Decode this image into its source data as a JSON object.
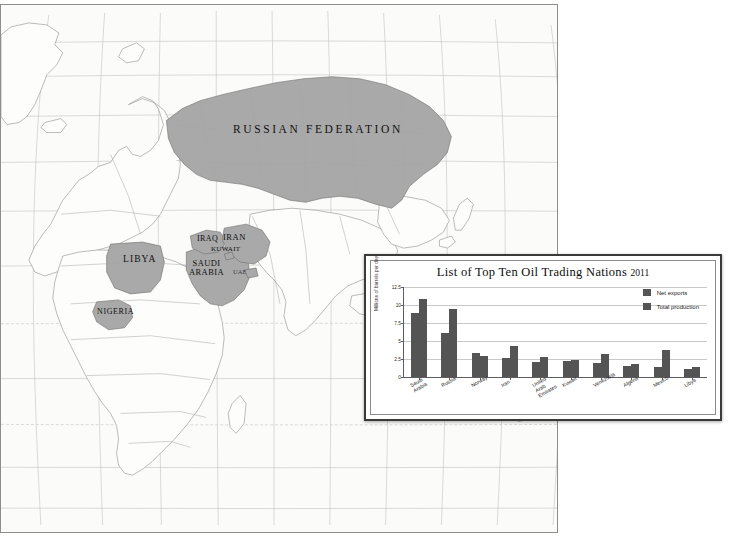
{
  "map": {
    "labels": [
      {
        "id": "russia",
        "text": "RUSSIAN FEDERATION"
      },
      {
        "id": "libya",
        "text": "LIBYA"
      },
      {
        "id": "nigeria",
        "text": "NIGERIA"
      },
      {
        "id": "iraq",
        "text": "IRAQ"
      },
      {
        "id": "iran",
        "text": "IRAN"
      },
      {
        "id": "kuwait",
        "text": "KUWAIT"
      },
      {
        "id": "saudi",
        "text": "SAUDI\nARABIA"
      },
      {
        "id": "uae",
        "text": "UAE"
      }
    ],
    "russia_label": "RUSSIAN FEDERATION",
    "libya_label": "LIBYA",
    "nigeria_label": "NIGERIA",
    "iraq_label": "IRAQ",
    "iran_label": "IRAN",
    "kuwait_label": "KUWAIT",
    "saudi_label_line1": "SAUDI",
    "saudi_label_line2": "ARABIA",
    "uae_label": "UAE",
    "highlight_color": "#a9a9a9",
    "land_color": "#fcfcfb",
    "border_color": "#9a9a9a"
  },
  "chart_data": {
    "type": "bar",
    "title": "List of Top Ten Oil Trading Nations",
    "title_year": "2011",
    "xlabel": "",
    "ylabel": "Millions of barrels per day",
    "ylim": [
      0,
      12.5
    ],
    "yticks": [
      0,
      2.5,
      5,
      7.5,
      10,
      12.5
    ],
    "ytick_labels": [
      "0",
      "2.5",
      "5",
      "7.5",
      "10",
      "12.5"
    ],
    "grid": true,
    "legend_position": "top-right",
    "bar_color": "#545454",
    "categories": [
      "Saudi Arabia",
      "Russia",
      "Norway",
      "Iran",
      "United Arab\nEmirates",
      "Kuwait",
      "Venezuela",
      "Algeria",
      "Mexico",
      "Libya"
    ],
    "series": [
      {
        "name": "Net exports",
        "values": [
          8.9,
          6.1,
          3.3,
          2.6,
          2.1,
          2.2,
          1.95,
          1.5,
          1.35,
          1.1
        ]
      },
      {
        "name": "Total production",
        "values": [
          10.8,
          9.4,
          2.9,
          4.3,
          2.8,
          2.4,
          3.2,
          1.8,
          3.7,
          1.4
        ]
      }
    ]
  }
}
